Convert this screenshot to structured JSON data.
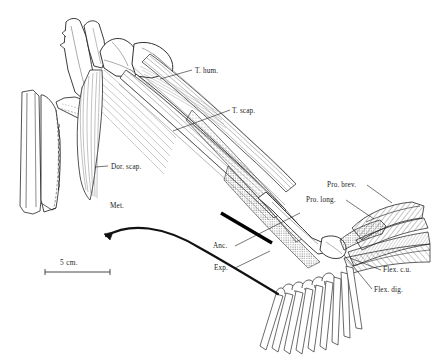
{
  "figure": {
    "kind": "anatomical-line-drawing",
    "background_color": "#ffffff",
    "ink_color": "#1a1a1a"
  },
  "scale_bar": {
    "label": "5 cm.",
    "x1": 45,
    "x2": 110,
    "y": 272
  },
  "labels": [
    {
      "id": "t-hum",
      "text": "T. hum.",
      "x": 195,
      "y": 72,
      "leader": [
        [
          190,
          75
        ],
        [
          160,
          83
        ]
      ]
    },
    {
      "id": "t-scap",
      "text": "T. scap.",
      "x": 232,
      "y": 112,
      "leader": [
        [
          229,
          115
        ],
        [
          173,
          133
        ]
      ]
    },
    {
      "id": "dor-scap",
      "text": "Dor. scap.",
      "x": 110,
      "y": 168,
      "leader": [
        [
          107,
          171
        ],
        [
          96,
          173
        ]
      ]
    },
    {
      "id": "met",
      "text": "Met.",
      "x": 110,
      "y": 207,
      "leader": []
    },
    {
      "id": "pro-brev",
      "text": "Pro. brev.",
      "x": 327,
      "y": 186,
      "leader": [
        [
          366,
          189
        ],
        [
          388,
          205
        ]
      ]
    },
    {
      "id": "pro-long",
      "text": "Pro. long.",
      "x": 306,
      "y": 201,
      "leader": [
        [
          345,
          204
        ],
        [
          371,
          220
        ]
      ]
    },
    {
      "id": "anc",
      "text": "Anc.",
      "x": 216,
      "y": 250,
      "leader": [
        [
          234,
          248
        ],
        [
          296,
          215
        ]
      ]
    },
    {
      "id": "exp",
      "text": "Exp.",
      "x": 216,
      "y": 271,
      "leader": [
        [
          234,
          270
        ],
        [
          268,
          252
        ]
      ]
    },
    {
      "id": "flex-cu",
      "text": "Flex. c.u.",
      "x": 383,
      "y": 274,
      "leader": [
        [
          381,
          272
        ],
        [
          352,
          259
        ]
      ]
    },
    {
      "id": "flex-dig",
      "text": "Flex. dig.",
      "x": 374,
      "y": 294,
      "leader": [
        [
          372,
          291
        ],
        [
          345,
          256
        ]
      ]
    }
  ],
  "anatomy": {
    "elements": [
      "vertebral-column",
      "scapula",
      "coracoid",
      "sternum",
      "humerus",
      "radius-ulna",
      "carpals",
      "metacarpals",
      "wing-finger-rays"
    ],
    "muscles": [
      "triceps-humeralis",
      "triceps-scapularis",
      "dorsalis-scapulae",
      "pronator-brevis",
      "pronator-longus",
      "anconeus",
      "extensor",
      "flexor-carpi-ulnaris",
      "flexor-digitorum"
    ],
    "digit_ray_count": 9
  }
}
